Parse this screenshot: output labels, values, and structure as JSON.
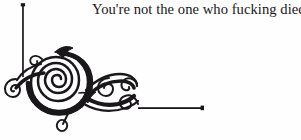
{
  "page": {
    "width": 301,
    "height": 140,
    "background_color": "#fefefe",
    "ink_color": "#19171a"
  },
  "quote": {
    "text": "You're not the one who fucking died",
    "font_style": "serif",
    "color": "#19171a",
    "align": "right"
  },
  "ornament": {
    "kind": "calligraphic-corner-flourish",
    "description": "Large inward-turning spiral with attached curling leaf-tendrils, forming a bracket corner",
    "color": "#19171a",
    "rules": [
      {
        "name": "vertical-rule",
        "orientation": "vertical",
        "x": 23,
        "y_start": 4,
        "y_end": 77,
        "terminal_dot": "top"
      },
      {
        "name": "horizontal-rule",
        "orientation": "horizontal",
        "y": 108,
        "x_start": 138,
        "x_end": 204,
        "terminal_dot": "right"
      }
    ],
    "spiral": {
      "center_x": 60,
      "center_y": 82,
      "outer_radius": 28,
      "turns": 2.6,
      "direction": "inward-clockwise"
    },
    "curls": [
      {
        "name": "left-curl",
        "center_x": 14,
        "center_y": 83,
        "radius": 7
      },
      {
        "name": "upper-left-curl",
        "center_x": 40,
        "center_y": 60,
        "radius": 5
      },
      {
        "name": "lower-drop-curl",
        "center_x": 62,
        "center_y": 121,
        "radius": 6
      },
      {
        "name": "mid-right-curl",
        "center_x": 103,
        "center_y": 88,
        "radius": 7
      },
      {
        "name": "far-right-curl",
        "center_x": 129,
        "center_y": 86,
        "radius": 6
      },
      {
        "name": "tail-curl",
        "center_x": 124,
        "center_y": 106,
        "radius": 8
      }
    ]
  }
}
